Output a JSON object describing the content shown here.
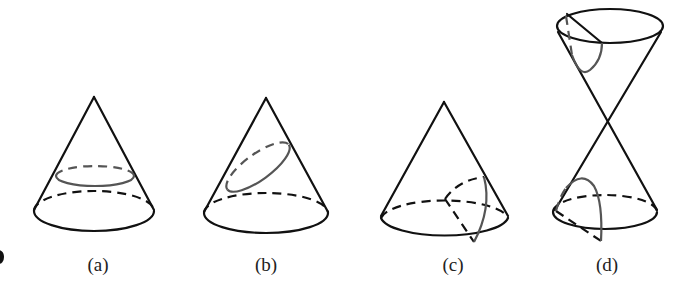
{
  "figure": {
    "panels": [
      {
        "id": "a",
        "label": "(a)",
        "section": "circle"
      },
      {
        "id": "b",
        "label": "(b)",
        "section": "ellipse"
      },
      {
        "id": "c",
        "label": "(c)",
        "section": "parabola"
      },
      {
        "id": "d",
        "label": "(d)",
        "section": "hyperbola"
      }
    ]
  },
  "colors": {
    "outline": "#111111",
    "section": "#555555",
    "background": "#ffffff"
  }
}
